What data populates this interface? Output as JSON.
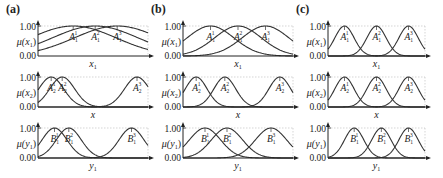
{
  "chart_data": [
    {
      "type": "line",
      "panel_label": "(a)",
      "subplots": [
        {
          "ylabel": "μ(x₁)",
          "xlabel": "x₁",
          "yticks": [
            "1.00",
            "0.00"
          ],
          "ylim": [
            0,
            1
          ],
          "series": [
            {
              "name": "A₁¹",
              "center": 0.32,
              "width": 0.55
            },
            {
              "name": "A₁²",
              "center": 0.52,
              "width": 0.55
            },
            {
              "name": "A₁³",
              "center": 0.72,
              "width": 0.55
            }
          ]
        },
        {
          "ylabel": "μ(x₂)",
          "xlabel": "x",
          "yticks": [
            "1.00",
            "0.00"
          ],
          "ylim": [
            0,
            1
          ],
          "series": [
            {
              "name": "A₂¹",
              "center": 0.12,
              "width": 0.16
            },
            {
              "name": "A₂²",
              "center": 0.22,
              "width": 0.16
            },
            {
              "name": "A₂³",
              "center": 0.9,
              "width": 0.16
            }
          ]
        },
        {
          "ylabel": "μ(y₁)",
          "xlabel": "y₁",
          "yticks": [
            "1.00",
            "0.00"
          ],
          "ylim": [
            0,
            1
          ],
          "series": [
            {
              "name": "B₁¹",
              "center": 0.15,
              "width": 0.16
            },
            {
              "name": "B₁²",
              "center": 0.28,
              "width": 0.16
            },
            {
              "name": "B₁³",
              "center": 0.85,
              "width": 0.16
            }
          ]
        }
      ]
    },
    {
      "type": "line",
      "panel_label": "(b)",
      "subplots": [
        {
          "ylabel": "μ(x₁)",
          "xlabel": "x₁",
          "yticks": [
            "1.00",
            "0.00"
          ],
          "ylim": [
            0,
            1
          ],
          "series": [
            {
              "name": "A₁¹",
              "center": 0.25,
              "width": 0.3
            },
            {
              "name": "A₁²",
              "center": 0.5,
              "width": 0.3
            },
            {
              "name": "A₁³",
              "center": 0.75,
              "width": 0.3
            }
          ]
        },
        {
          "ylabel": "μ(x₂)",
          "xlabel": "x",
          "yticks": [
            "1.00",
            "0.00"
          ],
          "ylim": [
            0,
            1
          ],
          "series": [
            {
              "name": "A₂¹",
              "center": 0.12,
              "width": 0.14
            },
            {
              "name": "A₂²",
              "center": 0.38,
              "width": 0.14
            },
            {
              "name": "A₂³",
              "center": 0.88,
              "width": 0.14
            }
          ]
        },
        {
          "ylabel": "μ(y₁)",
          "xlabel": "y₁",
          "yticks": [
            "1.00",
            "0.00"
          ],
          "ylim": [
            0,
            1
          ],
          "series": [
            {
              "name": "B₁¹",
              "center": 0.2,
              "width": 0.2
            },
            {
              "name": "B₁²",
              "center": 0.4,
              "width": 0.2
            },
            {
              "name": "B₁³",
              "center": 0.8,
              "width": 0.2
            }
          ]
        }
      ]
    },
    {
      "type": "line",
      "panel_label": "(c)",
      "subplots": [
        {
          "ylabel": "μ(x₁)",
          "xlabel": "x₁",
          "yticks": [
            "1.00",
            "0.00"
          ],
          "ylim": [
            0,
            1
          ],
          "series": [
            {
              "name": "A₁¹",
              "center": 0.17,
              "width": 0.14
            },
            {
              "name": "A₁²",
              "center": 0.5,
              "width": 0.14
            },
            {
              "name": "A₁³",
              "center": 0.83,
              "width": 0.14
            }
          ]
        },
        {
          "ylabel": "μ(x₂)",
          "xlabel": "x",
          "yticks": [
            "1.00",
            "0.00"
          ],
          "ylim": [
            0,
            1
          ],
          "series": [
            {
              "name": "A₂¹",
              "center": 0.17,
              "width": 0.14
            },
            {
              "name": "A₂²",
              "center": 0.5,
              "width": 0.14
            },
            {
              "name": "A₂³",
              "center": 0.83,
              "width": 0.14
            }
          ]
        },
        {
          "ylabel": "μ(y₁)",
          "xlabel": "y₁",
          "yticks": [
            "1.00",
            "0.00"
          ],
          "ylim": [
            0,
            1
          ],
          "series": [
            {
              "name": "B₁¹",
              "center": 0.27,
              "width": 0.14
            },
            {
              "name": "B₁²",
              "center": 0.55,
              "width": 0.14
            },
            {
              "name": "B₁³",
              "center": 0.83,
              "width": 0.14
            }
          ]
        }
      ]
    }
  ],
  "layout": {
    "panels_x": [
      {
        "axis_left": 38,
        "axis_right": 148,
        "label_x": 6
      },
      {
        "axis_left": 183,
        "axis_right": 293,
        "label_x": 151
      },
      {
        "axis_left": 328,
        "axis_right": 425,
        "label_x": 296
      }
    ],
    "rows_y": [
      {
        "top": 26,
        "bottom": 56
      },
      {
        "top": 77,
        "bottom": 107
      },
      {
        "top": 128,
        "bottom": 158
      }
    ],
    "curve_color": "#333333",
    "axis_color": "#222222",
    "grid_color": "#bbbbbb"
  }
}
